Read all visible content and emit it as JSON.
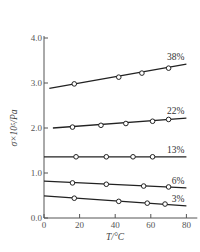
{
  "chart_data": {
    "type": "line",
    "title": "",
    "xlabel": "T/°C",
    "ylabel": "σ×10⁵/Pa",
    "xlim": [
      0,
      85
    ],
    "ylim": [
      0.0,
      4.0
    ],
    "xticks": [
      0,
      20,
      40,
      60,
      80
    ],
    "yticks": [
      0.0,
      1.0,
      2.0,
      3.0,
      4.0
    ],
    "xtick_labels": [
      "0",
      "20",
      "40",
      "60",
      "80"
    ],
    "ytick_labels": [
      "0.0",
      "1.0",
      "2.0",
      "3.0",
      "4.0"
    ],
    "grid": false,
    "legend_position": "inline labels at right end of lines",
    "series": [
      {
        "name": "38%",
        "line": [
          [
            3,
            2.88
          ],
          [
            80,
            3.42
          ]
        ],
        "points": [
          [
            17,
            2.98
          ],
          [
            42,
            3.13
          ],
          [
            55,
            3.22
          ],
          [
            70,
            3.33
          ]
        ]
      },
      {
        "name": "22%",
        "line": [
          [
            5,
            2.0
          ],
          [
            80,
            2.22
          ]
        ],
        "points": [
          [
            16,
            2.02
          ],
          [
            32,
            2.06
          ],
          [
            46,
            2.1
          ],
          [
            61,
            2.15
          ],
          [
            70,
            2.19
          ]
        ]
      },
      {
        "name": "13%",
        "line": [
          [
            0,
            1.36
          ],
          [
            80,
            1.36
          ]
        ],
        "points": [
          [
            18,
            1.36
          ],
          [
            35,
            1.36
          ],
          [
            50,
            1.36
          ],
          [
            61,
            1.36
          ]
        ]
      },
      {
        "name": "6%",
        "line": [
          [
            0,
            0.82
          ],
          [
            80,
            0.67
          ]
        ],
        "points": [
          [
            16,
            0.78
          ],
          [
            35,
            0.75
          ],
          [
            56,
            0.71
          ],
          [
            70,
            0.69
          ]
        ]
      },
      {
        "name": "3%",
        "line": [
          [
            0,
            0.49
          ],
          [
            80,
            0.27
          ]
        ],
        "points": [
          [
            17,
            0.44
          ],
          [
            42,
            0.37
          ],
          [
            58,
            0.33
          ],
          [
            68,
            0.31
          ]
        ]
      }
    ]
  },
  "labels": {
    "xlabel": "T/°C",
    "ylabel": "σ×10⁵/Pa"
  }
}
